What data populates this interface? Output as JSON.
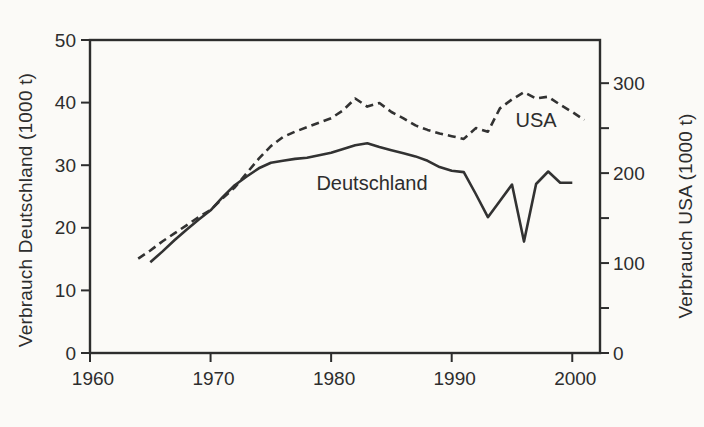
{
  "figure": {
    "background_color": "#fbfaf7",
    "ink_color": "#2d2d2d"
  },
  "chart_data": {
    "type": "line",
    "title": "",
    "grid": false,
    "legend": "inline series labels",
    "x_axis": {
      "ticks": [
        1960,
        1970,
        1980,
        1990,
        2000
      ],
      "range": [
        1960,
        2002.3
      ]
    },
    "left_axis": {
      "label": "Verbrauch Deutschland (1000 t)",
      "ticks": [
        0,
        10,
        20,
        30,
        40,
        50
      ],
      "range": [
        0,
        50
      ],
      "value_at_frame_top": 50
    },
    "right_axis": {
      "label": "Verbrauch USA (1000 t)",
      "ticks": [
        0,
        50,
        100,
        150,
        200,
        250,
        300
      ],
      "labeled_ticks": [
        0,
        100,
        200,
        300
      ],
      "range": [
        0,
        300
      ],
      "value_at_frame_top": 348
    },
    "series": [
      {
        "label": "Deutschland",
        "axis": "left",
        "line_style": "solid",
        "x": [
          1965,
          1966,
          1967,
          1968,
          1969,
          1970,
          1971,
          1972,
          1973,
          1974,
          1975,
          1976,
          1977,
          1978,
          1979,
          1980,
          1981,
          1982,
          1983,
          1984,
          1985,
          1986,
          1987,
          1988,
          1989,
          1990,
          1991,
          1992,
          1993,
          1994,
          1995,
          1996,
          1997,
          1998,
          1999,
          2000
        ],
        "values": [
          14.5,
          16.2,
          18.0,
          19.7,
          21.3,
          22.8,
          24.9,
          26.8,
          28.2,
          29.5,
          30.4,
          30.7,
          31.0,
          31.2,
          31.6,
          32.0,
          32.6,
          33.2,
          33.5,
          32.9,
          32.4,
          31.9,
          31.4,
          30.7,
          29.7,
          29.1,
          28.9,
          25.4,
          21.7,
          24.3,
          26.9,
          17.8,
          27.0,
          29.0,
          27.2,
          27.2
        ]
      },
      {
        "label": "USA",
        "axis": "right",
        "line_style": "dashed",
        "x": [
          1964,
          1965,
          1966,
          1967,
          1968,
          1969,
          1970,
          1971,
          1972,
          1973,
          1974,
          1975,
          1976,
          1977,
          1978,
          1979,
          1980,
          1981,
          1982,
          1983,
          1984,
          1985,
          1986,
          1987,
          1988,
          1989,
          1990,
          1991,
          1992,
          1993,
          1994,
          1995,
          1996,
          1997,
          1998,
          1999,
          2000,
          2001
        ],
        "values": [
          105,
          114,
          124,
          133,
          142,
          151,
          159,
          172,
          184,
          200,
          216,
          230,
          240,
          246,
          251,
          256,
          261,
          270,
          283,
          274,
          278,
          268,
          261,
          253,
          248,
          244,
          241,
          238,
          250,
          246,
          272,
          282,
          290,
          283,
          285,
          276,
          268,
          259
        ]
      }
    ]
  }
}
